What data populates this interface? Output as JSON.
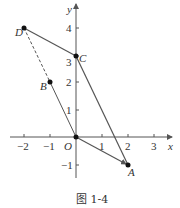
{
  "figure": {
    "caption": "图 1-4",
    "axes": {
      "x_label": "x",
      "y_label": "y",
      "origin_label": "O",
      "x_ticks": [
        "−2",
        "−1",
        "1",
        "2",
        "3"
      ],
      "y_ticks": [
        "4",
        "3",
        "2",
        "1",
        "−1"
      ]
    },
    "points": [
      {
        "name": "A",
        "x": 2,
        "y": -1
      },
      {
        "name": "B",
        "x": -1,
        "y": 2
      },
      {
        "name": "C",
        "x": 0,
        "y": 3
      },
      {
        "name": "D",
        "x": -2,
        "y": 4
      },
      {
        "name": "O",
        "x": 0,
        "y": 0
      }
    ],
    "segments": [
      {
        "from": "D",
        "to": "C",
        "style": "solid"
      },
      {
        "from": "C",
        "to": "A",
        "style": "solid"
      },
      {
        "from": "O",
        "to": "A",
        "style": "solid-arrow"
      },
      {
        "from": "B",
        "to": "O",
        "style": "solid"
      },
      {
        "from": "D",
        "to": "B",
        "style": "dashed"
      }
    ],
    "colors": {
      "line": "#555555",
      "point": "#111111",
      "text": "#333333"
    }
  }
}
